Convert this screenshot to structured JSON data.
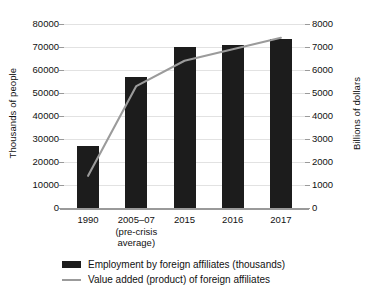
{
  "chart_data": {
    "type": "bar",
    "title": "",
    "subtitle": "",
    "categories": [
      "1990",
      "2005–07\n(pre-crisis\naverage)",
      "2015",
      "2016",
      "2017"
    ],
    "tick_labels_x": [
      {
        "line1": "1990",
        "line2": "",
        "line3": ""
      },
      {
        "line1": "2005–07",
        "line2": "(pre-crisis",
        "line3": "average)"
      },
      {
        "line1": "2015",
        "line2": "",
        "line3": ""
      },
      {
        "line1": "2016",
        "line2": "",
        "line3": ""
      },
      {
        "line1": "2017",
        "line2": "",
        "line3": ""
      }
    ],
    "series": [
      {
        "name": "Employment by foreign affiliates (thousands)",
        "type": "bar",
        "axis": "left",
        "color": "#1c1c1c",
        "values": [
          27000,
          57000,
          70000,
          71000,
          73500
        ]
      },
      {
        "name": "Value added (product) of foreign affiliates",
        "type": "line",
        "axis": "right",
        "color": "#9b9b9b",
        "values": [
          1400,
          5300,
          6400,
          6900,
          7400
        ]
      }
    ],
    "ylabel": "Thousands of people",
    "ylabel_right": "Billions of dollars",
    "xlabel": "",
    "ylim": [
      0,
      80000
    ],
    "ylim_right": [
      0,
      8000
    ],
    "yticks": [
      0,
      10000,
      20000,
      30000,
      40000,
      50000,
      60000,
      70000,
      80000
    ],
    "yticks_right": [
      0,
      1000,
      2000,
      3000,
      4000,
      5000,
      6000,
      7000,
      8000
    ],
    "ytick_labels": [
      "0",
      "10000",
      "20000",
      "30000",
      "40000",
      "50000",
      "60000",
      "70000",
      "80000"
    ],
    "ytick_labels_right": [
      "0",
      "1000",
      "2000",
      "3000",
      "4000",
      "5000",
      "6000",
      "7000",
      "8000"
    ],
    "grid": true,
    "legend_position": "bottom"
  },
  "legend": {
    "items": [
      {
        "label": "Employment by foreign affiliates (thousands)",
        "marker": "bar-swatch"
      },
      {
        "label": "Value added (product) of foreign affiliates",
        "marker": "line-swatch"
      }
    ]
  },
  "axes": {
    "left_title": "Thousands of people",
    "right_title": "Billions of dollars"
  }
}
